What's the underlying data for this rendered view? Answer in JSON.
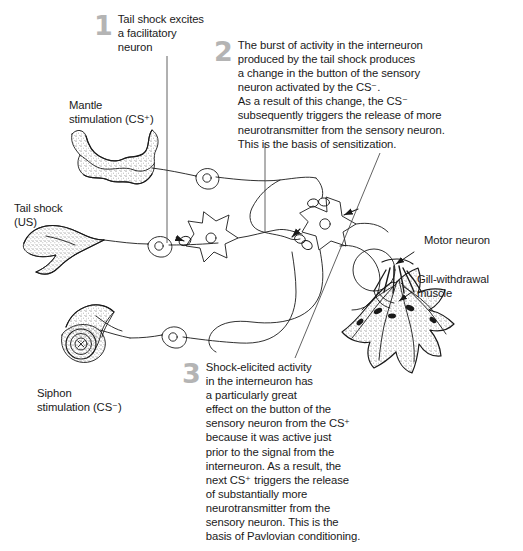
{
  "figure": {
    "background_color": "#ffffff",
    "ink_color": "#1a1a1a",
    "numeral_color": "#b4b4b4"
  },
  "callouts": [
    {
      "number": "1",
      "text": "Tail shock excites\na facilitatory\nneuron"
    },
    {
      "number": "2",
      "text": "The burst of activity in the interneuron\nproduced by the tail shock produces\na change in the button of the sensory\nneuron activated by the CS⁻.\nAs a result of this change, the CS⁻\nsubsequently triggers the release of more\nneurotransmitter from the sensory neuron.\nThis is the basis of sensitization."
    },
    {
      "number": "3",
      "text": "Shock-elicited activity\nin the interneuron has\na particularly great\neffect on the button of the\nsensory neuron from the CS⁺\nbecause it was active just\nprior to the signal from the\ninterneuron. As a result, the\nnext CS⁺ triggers the release\nof substantially more\nneurotransmitter from the\nsensory neuron. This is the\nbasis of Pavlovian conditioning."
    }
  ],
  "labels": [
    {
      "name": "mantle-stimulation",
      "text": "Mantle\nstimulation (CS⁺)"
    },
    {
      "name": "tail-shock",
      "text": "Tail shock\n(US)"
    },
    {
      "name": "siphon-stimulation",
      "text": "Siphon\nstimulation (CS⁻)"
    },
    {
      "name": "motor-neuron",
      "text": "Motor neuron"
    },
    {
      "name": "gill-withdrawal-muscle",
      "text": "Gill-withdrawal\nmuscle"
    }
  ],
  "anatomy": {
    "mantle": "mantle-tissue-drawing",
    "tail": "tail-tissue-drawing",
    "siphon": "siphon-tissue-drawing",
    "gill_muscle": "gill-withdrawal-muscle-drawing",
    "neurons": [
      {
        "name": "mantle-sensory-neuron",
        "type": "bipolar"
      },
      {
        "name": "tail-sensory-neuron",
        "type": "bipolar"
      },
      {
        "name": "siphon-sensory-neuron",
        "type": "bipolar"
      },
      {
        "name": "facilitatory-neuron",
        "type": "stellate"
      },
      {
        "name": "interneuron",
        "type": "stellate"
      },
      {
        "name": "motor-neuron",
        "type": "round"
      }
    ],
    "synaptic_buttons": [
      {
        "name": "button-cs-plus",
        "target": "interneuron"
      },
      {
        "name": "button-cs-minus",
        "target": "interneuron"
      },
      {
        "name": "button-facilitatory",
        "target": "facilitatory-neuron"
      }
    ]
  }
}
